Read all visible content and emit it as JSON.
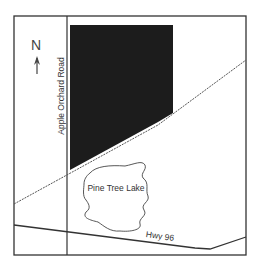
{
  "map": {
    "north_label": "N",
    "road_label": "Apple Orchard Road",
    "lake_label": "Pine Tree Lake",
    "highway_label": "Hwy 96",
    "colors": {
      "border": "#333333",
      "parcel_fill": "#1c1c1c",
      "line": "#333333",
      "background": "#ffffff"
    }
  }
}
